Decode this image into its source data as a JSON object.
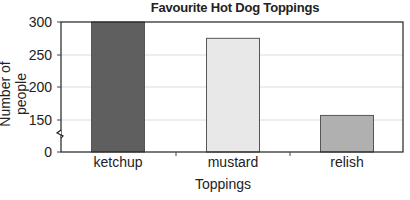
{
  "chart_data": {
    "type": "bar",
    "title": "Favourite Hot Dog Toppings",
    "xlabel": "Toppings",
    "ylabel": "Number of people",
    "categories": [
      "ketchup",
      "mustard",
      "relish"
    ],
    "values": [
      300,
      275,
      157
    ],
    "colors": [
      "#5f5f5f",
      "#e8e8e8",
      "#b0b0b0"
    ],
    "yticks": [
      0,
      150,
      200,
      250,
      300
    ],
    "ylim": [
      0,
      300
    ],
    "axis_break": "between 0 and 150",
    "grid": true,
    "legend": null
  }
}
